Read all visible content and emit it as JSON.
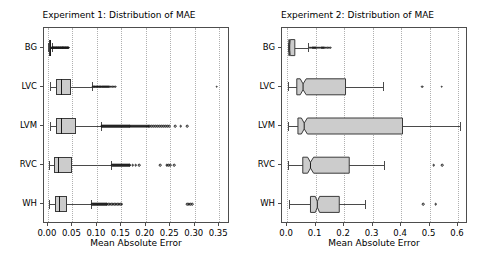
{
  "figure": {
    "width": 477,
    "height": 260,
    "background": "#ffffff",
    "box_fill_color": "#cccccc",
    "box_edge_color": "#3a3a3a",
    "grid_color": "#b0b0b0"
  },
  "chart_data": [
    {
      "type": "boxplot",
      "orientation": "horizontal",
      "title": "Experiment 1: Distribution of MAE",
      "xlabel": "Mean Absolute Error",
      "ylabel": "",
      "xlim": [
        -0.008,
        0.372
      ],
      "xticks": [
        0.0,
        0.05,
        0.1,
        0.15,
        0.2,
        0.25,
        0.3,
        0.35
      ],
      "xticklabels": [
        "0.00",
        "0.05",
        "0.10",
        "0.15",
        "0.20",
        "0.25",
        "0.30",
        "0.35"
      ],
      "categories": [
        "BG",
        "LVC",
        "LVM",
        "RVC",
        "WH"
      ],
      "grid": true,
      "grid_axis": "x",
      "notched": false,
      "legend": "none",
      "boxes": [
        {
          "category": "BG",
          "whisker_low": 0.0008,
          "q1": 0.0022,
          "median": 0.0033,
          "q3": 0.0049,
          "whisker_high": 0.0078,
          "fliers": [
            0.0085,
            0.0092,
            0.0099,
            0.0106,
            0.0113,
            0.012,
            0.0128,
            0.0135,
            0.0142,
            0.015,
            0.0158,
            0.0166,
            0.0174,
            0.0182,
            0.019,
            0.0198,
            0.0206,
            0.0214,
            0.0222,
            0.023,
            0.0238,
            0.0246,
            0.0254,
            0.0262,
            0.027,
            0.0278,
            0.0286,
            0.0294,
            0.0302,
            0.031,
            0.0318,
            0.0326,
            0.0334,
            0.0342,
            0.035,
            0.0358,
            0.0366,
            0.0374,
            0.0382,
            0.039,
            0.04,
            0.041,
            0.042
          ]
        },
        {
          "category": "LVC",
          "whisker_low": 0.0035,
          "q1": 0.0168,
          "median": 0.0268,
          "q3": 0.0465,
          "whisker_high": 0.0905,
          "fliers": [
            0.0925,
            0.0945,
            0.096,
            0.0975,
            0.099,
            0.1005,
            0.102,
            0.1035,
            0.105,
            0.1065,
            0.108,
            0.1095,
            0.111,
            0.113,
            0.115,
            0.117,
            0.119,
            0.121,
            0.123,
            0.125,
            0.128,
            0.131,
            0.134,
            0.137,
            0.3445
          ]
        },
        {
          "category": "LVM",
          "whisker_low": 0.0042,
          "q1": 0.0175,
          "median": 0.0262,
          "q3": 0.0575,
          "whisker_high": 0.1075,
          "fliers": [
            0.1095,
            0.1115,
            0.1135,
            0.1155,
            0.1175,
            0.1195,
            0.1215,
            0.1235,
            0.1255,
            0.1275,
            0.1295,
            0.1315,
            0.1335,
            0.1355,
            0.1375,
            0.1395,
            0.1415,
            0.1435,
            0.1455,
            0.1475,
            0.1495,
            0.1515,
            0.1535,
            0.1555,
            0.1575,
            0.1595,
            0.1615,
            0.1635,
            0.1655,
            0.1675,
            0.1695,
            0.1715,
            0.1735,
            0.1755,
            0.1775,
            0.1795,
            0.1815,
            0.1835,
            0.1855,
            0.1875,
            0.1895,
            0.1915,
            0.1935,
            0.1955,
            0.1975,
            0.1995,
            0.2015,
            0.2035,
            0.2055,
            0.2075,
            0.2115,
            0.2155,
            0.2195,
            0.2235,
            0.2275,
            0.2315,
            0.2355,
            0.2395,
            0.2435,
            0.2475,
            0.2595,
            0.2715,
            0.2845
          ]
        },
        {
          "category": "RVC",
          "whisker_low": 0.0028,
          "q1": 0.0128,
          "median": 0.0212,
          "q3": 0.0498,
          "whisker_high": 0.1295,
          "fliers": [
            0.1315,
            0.1335,
            0.1355,
            0.1375,
            0.1395,
            0.1415,
            0.1435,
            0.1455,
            0.1475,
            0.1495,
            0.1515,
            0.1535,
            0.1555,
            0.1575,
            0.1595,
            0.1615,
            0.1635,
            0.1655,
            0.1675,
            0.1735,
            0.1795,
            0.1865,
            0.2295,
            0.2425,
            0.2455,
            0.2495,
            0.2575
          ]
        },
        {
          "category": "WH",
          "whisker_low": 0.0025,
          "q1": 0.0142,
          "median": 0.0225,
          "q3": 0.0398,
          "whisker_high": 0.0885,
          "fliers": [
            0.0905,
            0.0925,
            0.0945,
            0.0965,
            0.0985,
            0.1005,
            0.1025,
            0.1045,
            0.1065,
            0.1085,
            0.1105,
            0.1125,
            0.1145,
            0.1165,
            0.1185,
            0.1205,
            0.1235,
            0.1265,
            0.1295,
            0.1325,
            0.1355,
            0.1385,
            0.1415,
            0.1445,
            0.1475,
            0.1505,
            0.2845,
            0.2875,
            0.2905,
            0.2945
          ]
        }
      ]
    },
    {
      "type": "boxplot",
      "orientation": "horizontal",
      "title": "Experiment 2: Distribution of MAE",
      "xlabel": "Mean Absolute Error",
      "ylabel": "",
      "xlim": [
        -0.018,
        0.635
      ],
      "xticks": [
        0.0,
        0.1,
        0.2,
        0.3,
        0.4,
        0.5,
        0.6
      ],
      "xticklabels": [
        "0.0",
        "0.1",
        "0.2",
        "0.3",
        "0.4",
        "0.5",
        "0.6"
      ],
      "categories": [
        "BG",
        "LVC",
        "LVM",
        "RVC",
        "WH"
      ],
      "grid": true,
      "grid_axis": "x",
      "notched": true,
      "legend": "none",
      "boxes": [
        {
          "category": "BG",
          "whisker_low": 0.002,
          "q1": 0.006,
          "median": 0.009,
          "q3": 0.027,
          "notch_low": 0.008,
          "notch_high": 0.011,
          "whisker_high": 0.072,
          "fliers": [
            0.079,
            0.083,
            0.087,
            0.091,
            0.095,
            0.099,
            0.103,
            0.107,
            0.111,
            0.115,
            0.119,
            0.123,
            0.127,
            0.131,
            0.136,
            0.141,
            0.146,
            0.152
          ]
        },
        {
          "category": "LVC",
          "whisker_low": 0.004,
          "q1": 0.034,
          "median": 0.056,
          "q3": 0.205,
          "notch_low": 0.046,
          "notch_high": 0.067,
          "whisker_high": 0.338,
          "fliers": [
            0.474,
            0.542
          ]
        },
        {
          "category": "LVM",
          "whisker_low": 0.004,
          "q1": 0.038,
          "median": 0.06,
          "q3": 0.405,
          "notch_low": 0.05,
          "notch_high": 0.071,
          "whisker_high": 0.608,
          "fliers": []
        },
        {
          "category": "RVC",
          "whisker_low": 0.003,
          "q1": 0.055,
          "median": 0.082,
          "q3": 0.218,
          "notch_low": 0.072,
          "notch_high": 0.093,
          "whisker_high": 0.341,
          "fliers": [
            0.515,
            0.545
          ]
        },
        {
          "category": "WH",
          "whisker_low": 0.008,
          "q1": 0.082,
          "median": 0.106,
          "q3": 0.183,
          "notch_low": 0.099,
          "notch_high": 0.114,
          "whisker_high": 0.272,
          "fliers": [
            0.478,
            0.522
          ]
        }
      ]
    }
  ]
}
